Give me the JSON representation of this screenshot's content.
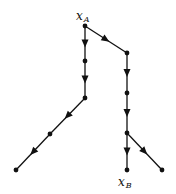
{
  "diagram": {
    "type": "directed-tree",
    "labels": {
      "source": {
        "base": "x",
        "sub": "A"
      },
      "target": {
        "base": "x",
        "sub": "B"
      }
    },
    "nodes": [
      {
        "id": "A",
        "x": 85,
        "y": 26,
        "label": "x_A"
      },
      {
        "id": "R1",
        "x": 127,
        "y": 53
      },
      {
        "id": "L1",
        "x": 85,
        "y": 61
      },
      {
        "id": "L2",
        "x": 85,
        "y": 98
      },
      {
        "id": "L3",
        "x": 50,
        "y": 134
      },
      {
        "id": "L4",
        "x": 16,
        "y": 170
      },
      {
        "id": "R2",
        "x": 127,
        "y": 93
      },
      {
        "id": "R3",
        "x": 127,
        "y": 133
      },
      {
        "id": "B",
        "x": 127,
        "y": 170,
        "label": "x_B"
      },
      {
        "id": "R4",
        "x": 162,
        "y": 170
      }
    ],
    "edges": [
      {
        "from": "A",
        "to": "R1",
        "arrow": true
      },
      {
        "from": "A",
        "to": "L1",
        "arrow": true
      },
      {
        "from": "L1",
        "to": "L2",
        "arrow": true
      },
      {
        "from": "L2",
        "to": "L3",
        "arrow": true
      },
      {
        "from": "L3",
        "to": "L4",
        "arrow": true
      },
      {
        "from": "R1",
        "to": "R2",
        "arrow": true
      },
      {
        "from": "R2",
        "to": "R3",
        "arrow": true
      },
      {
        "from": "R3",
        "to": "B",
        "arrow": true
      },
      {
        "from": "R3",
        "to": "R4",
        "arrow": true
      }
    ]
  }
}
